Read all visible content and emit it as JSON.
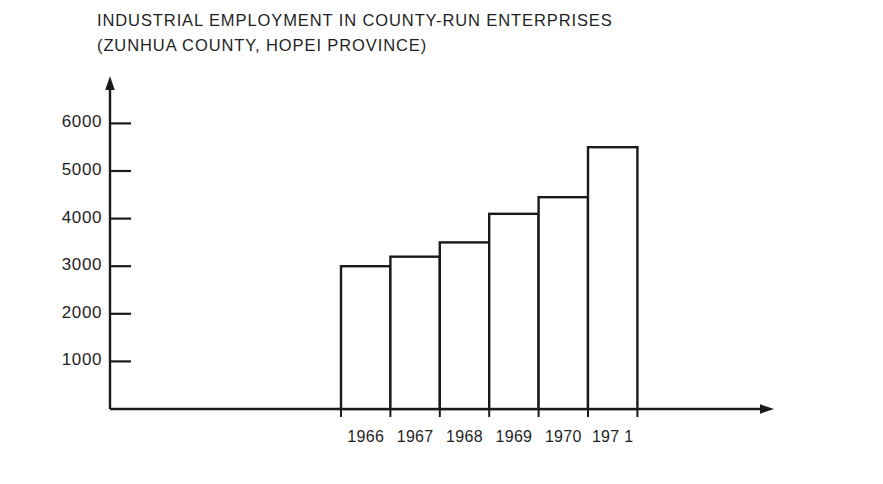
{
  "chart_data": {
    "type": "bar",
    "title": "INDUSTRIAL EMPLOYMENT IN COUNTY-RUN ENTERPRISES",
    "subtitle": "(ZUNHUA COUNTY, HOPEI PROVINCE)",
    "categories": [
      "1966",
      "1967",
      "1968",
      "1969",
      "1970",
      "197 1"
    ],
    "values": [
      3000,
      3200,
      3500,
      4100,
      4450,
      5500
    ],
    "xlabel": "",
    "ylabel": "",
    "ylim": [
      0,
      6500
    ],
    "yticks": [
      1000,
      2000,
      3000,
      4000,
      5000,
      6000
    ],
    "ytick_labels": [
      "1000",
      "2000",
      "3000",
      "4000",
      "5000",
      "6000"
    ],
    "grid": false,
    "legend": false,
    "bar_fill_color": "#ffffff",
    "bar_edge_color": "#1a1a1a",
    "axis_color": "#1a1a1a",
    "axis_style": "arrow-tipped open axes"
  },
  "figure": {
    "background_color": "#ffffff",
    "width": 883,
    "height": 484
  }
}
